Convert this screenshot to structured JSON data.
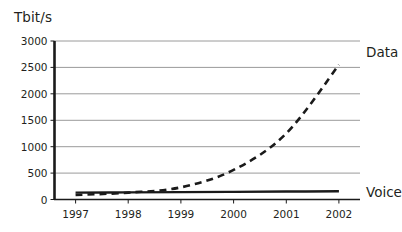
{
  "chart_data": {
    "type": "line",
    "title": "",
    "ylabel": "Tbit/s",
    "xlabel": "",
    "ylim": [
      0,
      3000
    ],
    "xlim": [
      1996.6,
      2002.4
    ],
    "grid": true,
    "legend_position": "right-inline",
    "yticks": [
      "0",
      "500",
      "1000",
      "1500",
      "2000",
      "2500",
      "3000"
    ],
    "ytick_values": [
      0,
      500,
      1000,
      1500,
      2000,
      2500,
      3000
    ],
    "categories": [
      "1997",
      "1998",
      "1999",
      "2000",
      "2001",
      "2002"
    ],
    "x": [
      1997,
      1998,
      1999,
      2000,
      2001,
      2002
    ],
    "series": [
      {
        "name": "Data",
        "style": "dashed",
        "color": "#1a1a1a",
        "values": [
          85,
          130,
          230,
          560,
          1250,
          2550
        ]
      },
      {
        "name": "Voice",
        "style": "solid",
        "color": "#1a1a1a",
        "values": [
          130,
          135,
          140,
          145,
          150,
          155
        ]
      }
    ],
    "annotations": [
      {
        "text": "Data",
        "x": 2002,
        "y": 2800
      },
      {
        "text": "Voice",
        "x": 2002,
        "y": 150
      }
    ]
  },
  "colors": {
    "grid": "#9a9a9a",
    "axis": "#1a1a1a",
    "background": "#ffffff",
    "text": "#231f20"
  }
}
